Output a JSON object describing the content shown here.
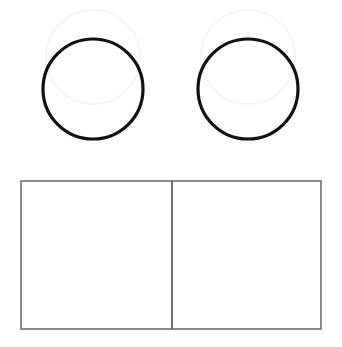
{
  "diagram": {
    "background": "#ffffff",
    "circles": [
      {
        "name": "left-circle",
        "cx": 93,
        "cy": 89,
        "r": 50,
        "stroke": "#111111",
        "stroke_width": 3.2
      },
      {
        "name": "right-circle",
        "cx": 248,
        "cy": 89,
        "r": 50,
        "stroke": "#111111",
        "stroke_width": 3.2
      }
    ],
    "faint_circles": [
      {
        "name": "left-faint-circle",
        "cx": 93,
        "cy": 57,
        "r": 47,
        "stroke": "#f2f2f2"
      },
      {
        "name": "right-faint-circle",
        "cx": 248,
        "cy": 57,
        "r": 47,
        "stroke": "#f2f2f2"
      }
    ],
    "boxes": [
      {
        "name": "left-square",
        "x": 21,
        "y": 181,
        "w": 151,
        "h": 148
      },
      {
        "name": "right-square",
        "x": 172,
        "y": 181,
        "w": 149,
        "h": 148
      }
    ],
    "box_stroke": "#666666",
    "box_stroke_width": 1.5
  }
}
